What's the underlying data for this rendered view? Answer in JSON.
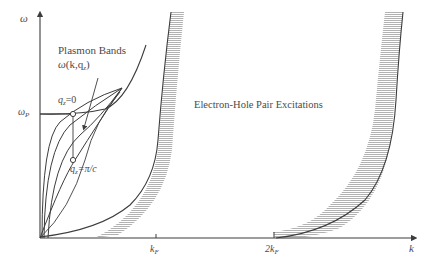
{
  "figure": {
    "axes": {
      "y_label": "ω",
      "x_label": "k",
      "y_tick": {
        "label": "ω",
        "sub": "P"
      },
      "x_ticks": [
        {
          "label": "k",
          "sub": "F"
        },
        {
          "label": "2k",
          "sub": "F"
        }
      ]
    },
    "annotations": {
      "plasmon_title": "Plasmon Bands",
      "plasmon_func": "ω(k,q",
      "plasmon_func_sub": "z",
      "plasmon_func_end": ")",
      "qz0_q": "q",
      "qz0_sub": "z",
      "qz0_val": "=0",
      "qzpi_q": "q",
      "qzpi_sub": "z",
      "qzpi_val": "=π/c",
      "eh_label": "Electron-Hole Pair Excitations"
    },
    "colors": {
      "ink": "#3c3c3c",
      "hatch": "#a8a8a8",
      "label": "#4a4a4a"
    }
  }
}
